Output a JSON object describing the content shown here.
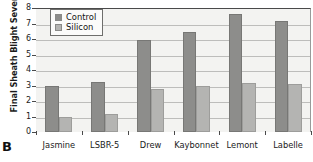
{
  "panel": {
    "letter": "B"
  },
  "legend": {
    "position": "top-left-inside",
    "entries": [
      {
        "label": "Control",
        "color": "#8d8d8b",
        "icon": "legend-swatch-icon"
      },
      {
        "label": "Silicon",
        "color": "#b4b4b2",
        "icon": "legend-swatch-icon"
      }
    ]
  },
  "axes": {
    "y_title": "Final Sheath Blight Severity",
    "y_ticks": [
      "0",
      "1",
      "2",
      "3",
      "4",
      "5",
      "6",
      "7",
      "8"
    ],
    "x_ticks": [
      "Jasmine",
      "LSBR-5",
      "Drew",
      "Kaybonnet",
      "Lemont",
      "Labelle"
    ]
  },
  "chart_data": {
    "type": "bar",
    "title": "",
    "subtitle": "",
    "xlabel": "",
    "ylabel": "Final Sheath Blight Severity",
    "ylim": [
      0,
      8
    ],
    "ytick_step": 1,
    "grid": true,
    "grid_axis": "y",
    "legend_position": "upper left",
    "categories": [
      "Jasmine",
      "LSBR-5",
      "Drew",
      "Kaybonnet",
      "Lemont",
      "Labelle"
    ],
    "series": [
      {
        "name": "Control",
        "color": "#8d8d8b",
        "values": [
          3.0,
          3.2,
          5.95,
          6.45,
          7.6,
          7.15
        ]
      },
      {
        "name": "Silicon",
        "color": "#b4b4b2",
        "values": [
          1.0,
          1.15,
          2.8,
          3.0,
          3.15,
          3.1
        ]
      }
    ],
    "annotations": [
      "B"
    ]
  }
}
